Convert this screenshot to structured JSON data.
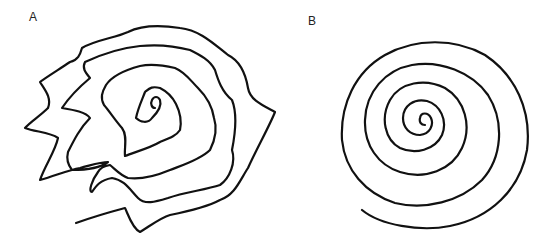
{
  "figure": {
    "panels": [
      {
        "label": "A",
        "description": "irregular tremulous hand-drawn spiral"
      },
      {
        "label": "B",
        "description": "smooth regular hand-drawn spiral"
      }
    ],
    "stroke_color": "#111111",
    "background": "#ffffff"
  }
}
